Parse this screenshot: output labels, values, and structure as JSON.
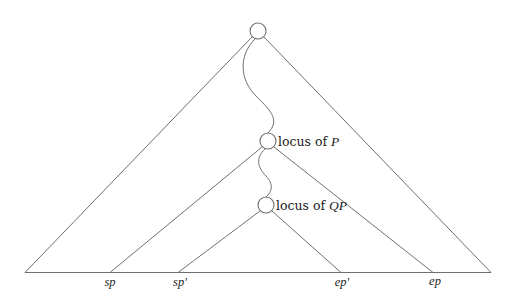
{
  "diagram": {
    "type": "tree-triangles",
    "colors": {
      "line": "#6f6f6f",
      "text": "#222222",
      "background": "#ffffff"
    },
    "nodes": [
      {
        "id": "root",
        "label": ""
      },
      {
        "id": "P",
        "label_prefix": "locus of ",
        "label_var": "P"
      },
      {
        "id": "QP",
        "label_prefix": "locus of ",
        "label_var": "QP"
      }
    ],
    "baseline_labels": [
      {
        "id": "sp",
        "text": "sp"
      },
      {
        "id": "sp_prime",
        "text": "sp′"
      },
      {
        "id": "ep_prime",
        "text": "ep′"
      },
      {
        "id": "ep",
        "text": "ep"
      }
    ]
  }
}
